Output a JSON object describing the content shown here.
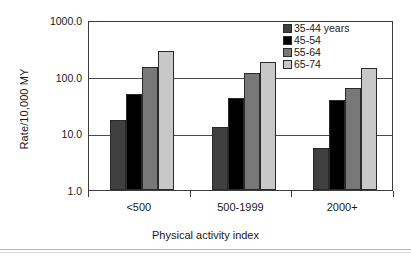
{
  "chart_data": {
    "type": "bar",
    "title": "",
    "subtitle": "",
    "xlabel": "Physical activity index",
    "ylabel": "Rate/10,000 MY",
    "categories": [
      "<500",
      "500-1999",
      "2000+"
    ],
    "yscale": "log",
    "ylim": [
      1.0,
      1000.0
    ],
    "ytick_labels": [
      "1000.0",
      "100.0",
      "10.0",
      "1.0"
    ],
    "ytick_values": [
      1000.0,
      100.0,
      10.0,
      1.0
    ],
    "grid": "horizontal",
    "legend_position": "top-right",
    "series": [
      {
        "name": "35-44 years",
        "color": "#404040",
        "values": [
          17.5,
          13.0,
          5.5
        ]
      },
      {
        "name": "45-54",
        "color": "#000000",
        "values": [
          50.0,
          42.0,
          38.0
        ]
      },
      {
        "name": "55-64",
        "color": "#787878",
        "values": [
          150.0,
          115.0,
          62.0
        ]
      },
      {
        "name": "65-74",
        "color": "#c8c8c8",
        "values": [
          285.0,
          185.0,
          145.0
        ]
      }
    ]
  }
}
